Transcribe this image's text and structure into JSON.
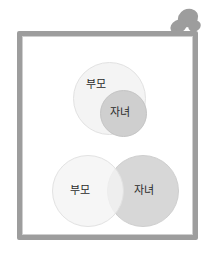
{
  "illustration": {
    "title": "",
    "frame": {
      "border_color": "#9d9d9d",
      "background": "#ffffff"
    },
    "pushpin": {
      "icon": "pushpin-icon",
      "color": "#9d9d9d"
    },
    "diagrams": [
      {
        "id": "subset",
        "type": "venn-subset",
        "description": "",
        "sets": [
          {
            "label": "부모",
            "role": "outer",
            "color": "#f4f4f4"
          },
          {
            "label": "자녀",
            "role": "inner",
            "color": "#cfcfcf"
          }
        ]
      },
      {
        "id": "overlap",
        "type": "venn-overlap",
        "description": "",
        "sets": [
          {
            "label": "부모",
            "role": "left",
            "color": "#f4f4f4"
          },
          {
            "label": "자녀",
            "role": "right",
            "color": "#d4d4d4"
          }
        ]
      }
    ]
  }
}
